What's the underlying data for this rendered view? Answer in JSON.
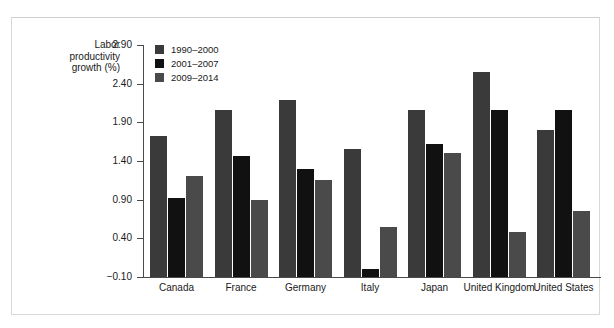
{
  "chart_data": {
    "type": "bar",
    "title": "",
    "xlabel": "",
    "ylabel": "Labor\nproductivity\ngrowth (%)",
    "categories": [
      "Canada",
      "France",
      "Germany",
      "Italy",
      "Japan",
      "United Kingdom",
      "United States"
    ],
    "series": [
      {
        "name": "1990–2000",
        "color": "#3a3a3a",
        "values": [
          1.72,
          2.06,
          2.19,
          1.56,
          2.06,
          2.55,
          1.8
        ]
      },
      {
        "name": "2001–2007",
        "color": "#111111",
        "values": [
          0.92,
          1.46,
          1.3,
          0.01,
          1.62,
          2.06,
          2.06
        ]
      },
      {
        "name": "2009–2014",
        "color": "#4a4a4a",
        "values": [
          1.2,
          0.9,
          1.16,
          0.55,
          1.51,
          0.48,
          0.76
        ]
      }
    ],
    "yticks": [
      "2.90",
      "2.40",
      "1.90",
      "1.40",
      "0.90",
      "0.40",
      "−0.10"
    ],
    "ytick_values": [
      2.9,
      2.4,
      1.9,
      1.4,
      0.9,
      0.4,
      -0.1
    ],
    "ylim": [
      -0.1,
      2.9
    ],
    "grid": false,
    "legend_position": "top-left-inside"
  }
}
